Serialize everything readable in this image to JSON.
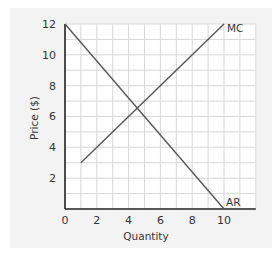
{
  "chart_data": {
    "type": "line",
    "title": "",
    "xlabel": "Quantity",
    "ylabel": "Price ($)",
    "xlim": [
      0,
      12
    ],
    "ylim": [
      0,
      12
    ],
    "grid": true,
    "x_ticks": [
      "0",
      "2",
      "4",
      "6",
      "8",
      "10"
    ],
    "y_ticks": [
      "2",
      "4",
      "6",
      "8",
      "10",
      "12"
    ],
    "series": [
      {
        "name": "MC",
        "label": "MC",
        "points": [
          [
            1,
            3
          ],
          [
            10,
            12
          ]
        ]
      },
      {
        "name": "AR",
        "label": "AR",
        "points": [
          [
            0,
            12
          ],
          [
            10,
            0
          ]
        ]
      }
    ],
    "annotations": [
      "MC",
      "AR"
    ],
    "line_color": "#555555",
    "grid_color": "#d8d8d8",
    "axis_color": "#222222"
  }
}
